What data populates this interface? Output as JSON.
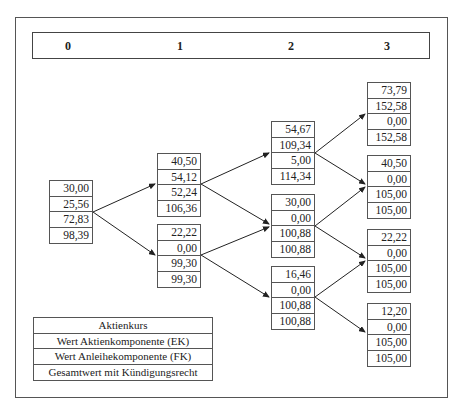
{
  "periods": [
    "0",
    "1",
    "2",
    "3"
  ],
  "nodes": {
    "t0": [
      "30,00",
      "25,56",
      "72,83",
      "98,39"
    ],
    "t1_u": [
      "40,50",
      "54,12",
      "52,24",
      "106,36"
    ],
    "t1_d": [
      "22,22",
      "0,00",
      "99,30",
      "99,30"
    ],
    "t2_uu": [
      "54,67",
      "109,34",
      "5,00",
      "114,34"
    ],
    "t2_ud": [
      "30,00",
      "0,00",
      "100,88",
      "100,88"
    ],
    "t2_dd": [
      "16,46",
      "0,00",
      "100,88",
      "100,88"
    ],
    "t3_uuu": [
      "73,79",
      "152,58",
      "0,00",
      "152,58"
    ],
    "t3_uud": [
      "40,50",
      "0,00",
      "105,00",
      "105,00"
    ],
    "t3_udd": [
      "22,22",
      "0,00",
      "105,00",
      "105,00"
    ],
    "t3_ddd": [
      "12,20",
      "0,00",
      "105,00",
      "105,00"
    ]
  },
  "legend": [
    "Aktienkurs",
    "Wert Aktienkomponente (EK)",
    "Wert Anleihekomponente (FK)",
    "Gesamtwert mit Kündigungsrecht"
  ]
}
